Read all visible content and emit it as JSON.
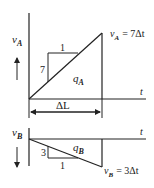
{
  "top_graph": {
    "y_axis_label": "v",
    "y_axis_sub": "A",
    "x_axis_label": "t",
    "area_label": "q",
    "area_sub": "A",
    "slope_rise": "7",
    "slope_run": "1",
    "end_value_v": "v",
    "end_value_sub": "A",
    "end_value_eq": "= 7Δt",
    "direction": "up"
  },
  "dimension": {
    "label": "ΔL"
  },
  "bottom_graph": {
    "y_axis_label": "v",
    "y_axis_sub": "B",
    "x_axis_label": "t",
    "area_label": "q",
    "area_sub": "B",
    "slope_rise": "3",
    "slope_run": "1",
    "end_value_v": "v",
    "end_value_sub": "B",
    "end_value_eq": "= 3Δt",
    "direction": "down"
  }
}
